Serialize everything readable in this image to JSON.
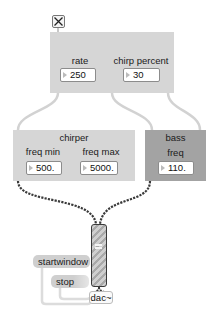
{
  "patch": {
    "toggle": {
      "state": "on",
      "icon": "x-toggle"
    },
    "control_panel": {
      "rate": {
        "label": "rate",
        "value": "250"
      },
      "chirp_percent": {
        "label": "chirp percent",
        "value": "30"
      }
    },
    "chirper_panel": {
      "title": "chirper",
      "freq_min": {
        "label": "freq min",
        "value": "500."
      },
      "freq_max": {
        "label": "freq max",
        "value": "5000."
      }
    },
    "bass_panel": {
      "title": "bass",
      "freq": {
        "label": "freq",
        "value": "110."
      }
    },
    "messages": {
      "startwindow": "startwindow",
      "stop": "stop"
    },
    "dac": {
      "label": "dac~"
    }
  },
  "colors": {
    "panel_light": "#d6d6d6",
    "panel_dark": "#a3a3a3",
    "cable_control": "#d0d0d0",
    "cable_signal": "#3a3a3a"
  }
}
